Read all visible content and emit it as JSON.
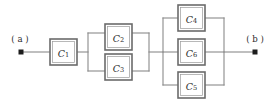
{
  "diagram": {
    "type": "capacitor-network-circuit",
    "background_color": "#ffffff",
    "wire_color": "#8a8a8a",
    "box_border_color": "#6b6b6b",
    "label_color": "#2b2b2b",
    "terminals": [
      {
        "id": "a",
        "label": "( a )",
        "x": 20,
        "y": 52,
        "label_x": 20,
        "label_y": 39
      },
      {
        "id": "b",
        "label": "( b )",
        "x": 255,
        "y": 52,
        "label_x": 255,
        "label_y": 39
      }
    ],
    "components": [
      {
        "id": "C1",
        "letter": "C",
        "subscript": "1",
        "x": 50,
        "y": 39,
        "w": 27,
        "h": 26,
        "group": "series"
      },
      {
        "id": "C2",
        "letter": "C",
        "subscript": "2",
        "x": 105,
        "y": 24,
        "w": 27,
        "h": 26,
        "group": "parallel-2"
      },
      {
        "id": "C3",
        "letter": "C",
        "subscript": "3",
        "x": 105,
        "y": 54,
        "w": 27,
        "h": 26,
        "group": "parallel-2"
      },
      {
        "id": "C4",
        "letter": "C",
        "subscript": "4",
        "x": 178,
        "y": 5,
        "w": 27,
        "h": 26,
        "group": "parallel-3"
      },
      {
        "id": "C6",
        "letter": "C",
        "subscript": "6",
        "x": 178,
        "y": 39,
        "w": 27,
        "h": 26,
        "group": "parallel-3"
      },
      {
        "id": "C5",
        "letter": "C",
        "subscript": "5",
        "x": 178,
        "y": 72,
        "w": 27,
        "h": 26,
        "group": "parallel-3"
      }
    ],
    "wires": [
      {
        "id": "lead-a-to-c1",
        "d": "M 22 52 L 50 52"
      },
      {
        "id": "c1-to-block2-left",
        "d": "M 77 52 L 88 52"
      },
      {
        "id": "block2-left-bus",
        "d": "M 88 33 L 88 71"
      },
      {
        "id": "block2-top-left",
        "d": "M 88 33 L 105 33"
      },
      {
        "id": "block2-bottom-left",
        "d": "M 88 71 L 105 71"
      },
      {
        "id": "block2-top-right",
        "d": "M 132 33 L 149 33"
      },
      {
        "id": "block2-bottom-right",
        "d": "M 132 71 L 149 71"
      },
      {
        "id": "block2-right-bus",
        "d": "M 149 33 L 149 71"
      },
      {
        "id": "block2-to-block3",
        "d": "M 149 52 L 163 52"
      },
      {
        "id": "block3-left-bus",
        "d": "M 163 18 L 163 85"
      },
      {
        "id": "block3-top-left",
        "d": "M 163 18 L 178 18"
      },
      {
        "id": "block3-mid-left",
        "d": "M 163 52 L 178 52"
      },
      {
        "id": "block3-bottom-left",
        "d": "M 163 85 L 178 85"
      },
      {
        "id": "block3-top-right",
        "d": "M 205 18 L 224 18"
      },
      {
        "id": "block3-mid-right",
        "d": "M 205 52 L 224 52"
      },
      {
        "id": "block3-bottom-right",
        "d": "M 205 85 L 224 85"
      },
      {
        "id": "block3-right-bus",
        "d": "M 224 18 L 224 85"
      },
      {
        "id": "lead-block3-to-b",
        "d": "M 224 52 L 254 52"
      }
    ]
  }
}
